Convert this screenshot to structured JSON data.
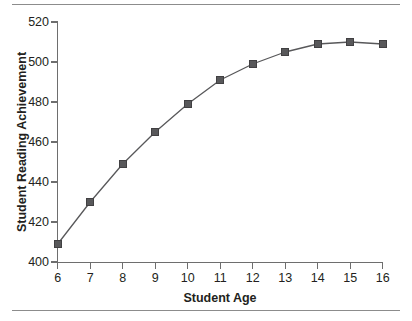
{
  "figure": {
    "background": "#ffffff",
    "rule_color": "#8c8c8c",
    "axis_color": "#6e6e6e",
    "marker_color": "#58585a",
    "line_color": "#58585a",
    "text_color": "#231f20"
  },
  "chart_data": {
    "type": "line",
    "title": "",
    "xlabel": "Student Age",
    "ylabel": "Student Reading Achievement",
    "x": [
      6,
      7,
      8,
      9,
      10,
      11,
      12,
      13,
      14,
      15,
      16
    ],
    "values": [
      409,
      430,
      449,
      465,
      479,
      491,
      499,
      505,
      509,
      510,
      509
    ],
    "series": [
      {
        "name": "Student Reading Achievement",
        "values": [
          409,
          430,
          449,
          465,
          479,
          491,
          499,
          505,
          509,
          510,
          509
        ]
      }
    ],
    "xlim": [
      6,
      16
    ],
    "ylim": [
      400,
      520
    ],
    "xticks": [
      6,
      7,
      8,
      9,
      10,
      11,
      12,
      13,
      14,
      15,
      16
    ],
    "yticks": [
      400,
      420,
      440,
      460,
      480,
      500,
      520
    ],
    "xticklabels": [
      "6",
      "7",
      "8",
      "9",
      "10",
      "11",
      "12",
      "13",
      "14",
      "15",
      "16"
    ],
    "yticklabels": [
      "400",
      "420",
      "440",
      "460",
      "480",
      "500",
      "520"
    ],
    "grid": false,
    "legend": false,
    "marker": "square",
    "tick_direction": "out"
  }
}
